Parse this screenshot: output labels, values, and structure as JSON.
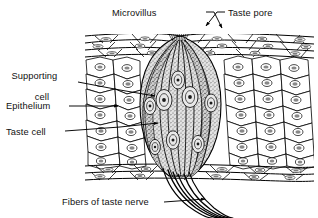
{
  "figure": {
    "kind": "histology-diagram",
    "background_color": "#ffffff",
    "ink_color": "#000000",
    "taste_bud_fill": "#cfcfcf",
    "width": 318,
    "height": 218
  },
  "labels": {
    "microvillus": "Microvillus",
    "taste_pore": "Taste pore",
    "supporting_cell_line1": "Supporting",
    "supporting_cell_line2": "cell",
    "epithelium": "Epithelium",
    "taste_cell": "Taste cell",
    "fibers_of_taste_nerve": "Fibers of taste nerve"
  },
  "structures": {
    "epithelium_tissue": "epithelium-tissue-block",
    "squamous_top_layer": "flattened-squamous-cell-layer-top",
    "squamous_bottom_layer": "flattened-squamous-cell-layer-bottom",
    "polygonal_cell_layer": "polygonal-epithelial-cell-layer",
    "taste_bud": "taste-bud",
    "taste_pore_opening": "taste-pore-opening",
    "microvilli_tuft": "microvilli-tuft",
    "taste_cells": "taste-cell-group",
    "supporting_cells": "supporting-cell-group",
    "nerve_fibers": "taste-nerve-fiber-bundle"
  },
  "leader_lines": {
    "microvillus": "leader-microvillus",
    "taste_pore": "leader-taste-pore",
    "supporting_cell": "leader-supporting-cell",
    "epithelium": "leader-epithelium",
    "taste_cell": "leader-taste-cell",
    "fibers": "leader-fibers-of-taste-nerve"
  }
}
